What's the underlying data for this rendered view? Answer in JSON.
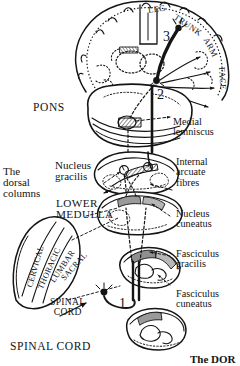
{
  "figure": {
    "title_partial": "The DOR",
    "domain": "neuroanatomy-illustration",
    "ink_color": "#141414",
    "paper_color": "#ffffff",
    "shade_color": "#8d8d8d"
  },
  "homunculus": {
    "labels": [
      {
        "text": "LEG",
        "angle": -8
      },
      {
        "text": "TRUNK",
        "angle": 34
      },
      {
        "text": "ARM",
        "angle": 62
      },
      {
        "text": "FACE",
        "angle": 86
      }
    ]
  },
  "neuron_markers": [
    {
      "id": "3",
      "label": "3"
    },
    {
      "id": "2",
      "label": "2"
    },
    {
      "id": "1",
      "label": "1"
    }
  ],
  "left_labels": [
    {
      "name": "pons",
      "text": "PONS"
    },
    {
      "name": "dorsal-columns",
      "text": "The\ndorsal\ncolumns"
    },
    {
      "name": "nucleus-gracilis",
      "text": "Nucleus\ngracilis"
    },
    {
      "name": "lower-medulla",
      "text": "LOWER\nMEDULLA"
    },
    {
      "name": "spinal-cord-mid",
      "text": "SPINAL\nCORD"
    },
    {
      "name": "spinal-cord-low",
      "text": "SPINAL CORD"
    }
  ],
  "right_labels": [
    {
      "name": "medial-lemniscus",
      "text": "Medial\nlemniscus"
    },
    {
      "name": "internal-arcuate",
      "text": "Internal\narcuate\nfibres"
    },
    {
      "name": "nucleus-cuneatus",
      "text": "Nucleus\ncuneatus"
    },
    {
      "name": "fasciculus-gracilis",
      "text": "Fasciculus\ngracilis"
    },
    {
      "name": "fasciculus-cuneatus",
      "text": "Fasciculus\ncuneatus"
    }
  ],
  "lamination_fan": {
    "name": "dorsal-column-lamination",
    "segments": [
      {
        "text": "CERVICAL",
        "angle": -74
      },
      {
        "text": "THORACIC",
        "angle": -62
      },
      {
        "text": "LUMBAR",
        "angle": -50
      },
      {
        "text": "SACRAL",
        "angle": -40
      }
    ]
  }
}
